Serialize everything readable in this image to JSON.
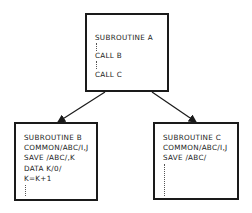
{
  "diagram": {
    "nodes": [
      {
        "id": "A",
        "lines": [
          "SUBROUTINE  A",
          "CALL  B",
          "CALL  C"
        ]
      },
      {
        "id": "B",
        "lines": [
          "SUBROUTINE  B",
          "COMMON/ABC/I,J",
          "SAVE /ABC/,K",
          "DATA K/0/",
          "K=K+1"
        ]
      },
      {
        "id": "C",
        "lines": [
          "SUBROUTINE  C",
          "COMMON/ABC/I,J",
          "SAVE /ABC/"
        ]
      }
    ],
    "edges": [
      {
        "from": "A",
        "to": "B"
      },
      {
        "from": "A",
        "to": "C"
      }
    ]
  }
}
